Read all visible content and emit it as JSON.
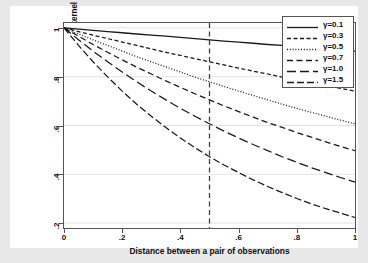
{
  "chart_data": {
    "type": "line",
    "title": "",
    "xlabel": "Distance between a pair of observations",
    "ylabel": "Radial Basis Function (RBF) kernel",
    "xlim": [
      0,
      1
    ],
    "ylim": [
      0.18,
      1.02
    ],
    "xticks": [
      "0",
      ".2",
      ".4",
      ".6",
      ".8",
      "1"
    ],
    "xtick_values": [
      0,
      0.2,
      0.4,
      0.6,
      0.8,
      1
    ],
    "yticks": [
      "1",
      ".8",
      ".6",
      ".4",
      ".2"
    ],
    "ytick_values": [
      1,
      0.8,
      0.6,
      0.4,
      0.2
    ],
    "grid": "horizontal",
    "legend_position": "top-right",
    "x": [
      0,
      0.05,
      0.1,
      0.15,
      0.2,
      0.25,
      0.3,
      0.35,
      0.4,
      0.45,
      0.5,
      0.55,
      0.6,
      0.65,
      0.7,
      0.75,
      0.8,
      0.85,
      0.9,
      0.95,
      1
    ],
    "series": [
      {
        "name": "γ=0.1",
        "gamma": 0.1,
        "dash": "solid",
        "values": [
          1,
          0.995,
          0.99,
          0.985,
          0.98,
          0.975,
          0.97,
          0.966,
          0.961,
          0.956,
          0.951,
          0.946,
          0.942,
          0.937,
          0.932,
          0.928,
          0.923,
          0.919,
          0.914,
          0.909,
          0.905
        ]
      },
      {
        "name": "γ=0.3",
        "gamma": 0.3,
        "dash": "short-dash",
        "values": [
          1,
          0.985,
          0.97,
          0.956,
          0.942,
          0.928,
          0.914,
          0.9,
          0.887,
          0.874,
          0.861,
          0.848,
          0.835,
          0.823,
          0.811,
          0.798,
          0.787,
          0.775,
          0.763,
          0.752,
          0.741
        ]
      },
      {
        "name": "γ=0.5",
        "gamma": 0.5,
        "dash": "dotted",
        "values": [
          1,
          0.975,
          0.951,
          0.928,
          0.905,
          0.882,
          0.861,
          0.84,
          0.819,
          0.798,
          0.779,
          0.76,
          0.741,
          0.723,
          0.705,
          0.687,
          0.67,
          0.654,
          0.638,
          0.622,
          0.607
        ]
      },
      {
        "name": "γ=0.7",
        "gamma": 0.7,
        "dash": "medium-dash",
        "values": [
          1,
          0.966,
          0.932,
          0.9,
          0.869,
          0.839,
          0.811,
          0.783,
          0.756,
          0.73,
          0.705,
          0.68,
          0.657,
          0.634,
          0.612,
          0.592,
          0.571,
          0.552,
          0.533,
          0.514,
          0.497
        ]
      },
      {
        "name": "γ=1.0",
        "gamma": 1.0,
        "dash": "long-dash",
        "values": [
          1,
          0.951,
          0.905,
          0.861,
          0.819,
          0.779,
          0.741,
          0.705,
          0.67,
          0.638,
          0.607,
          0.577,
          0.549,
          0.522,
          0.497,
          0.472,
          0.449,
          0.427,
          0.407,
          0.387,
          0.368
        ]
      },
      {
        "name": "γ=1.5",
        "gamma": 1.5,
        "dash": "dash-dot",
        "values": [
          1,
          0.928,
          0.861,
          0.799,
          0.741,
          0.687,
          0.638,
          0.592,
          0.549,
          0.509,
          0.472,
          0.438,
          0.407,
          0.377,
          0.35,
          0.325,
          0.301,
          0.279,
          0.259,
          0.241,
          0.223
        ]
      }
    ],
    "annotations": [
      {
        "type": "vertical-reference-line",
        "x": 0.5,
        "style": "dashed",
        "color": "#404040"
      }
    ],
    "colors": {
      "line": "#1a1a1a",
      "axis": "#555555",
      "grid": "#e3e3e3",
      "plot_background": "#ffffff",
      "figure_background": "#e8e8e8",
      "inner_background": "#ffffff"
    }
  },
  "legend": {
    "entries": [
      {
        "label": "γ=0.1"
      },
      {
        "label": "γ=0.3"
      },
      {
        "label": "γ=0.5"
      },
      {
        "label": "γ=0.7"
      },
      {
        "label": "γ=1.0"
      },
      {
        "label": "γ=1.5"
      }
    ]
  }
}
